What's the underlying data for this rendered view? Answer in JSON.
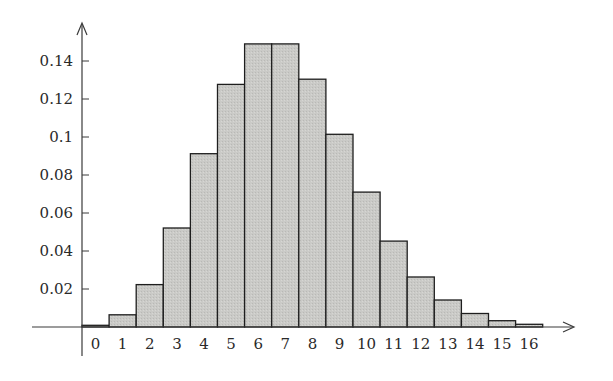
{
  "chart_data": {
    "type": "bar",
    "title": "",
    "xlabel": "",
    "ylabel": "",
    "categories": [
      "0",
      "1",
      "2",
      "3",
      "4",
      "5",
      "6",
      "7",
      "8",
      "9",
      "10",
      "11",
      "12",
      "13",
      "14",
      "15",
      "16"
    ],
    "values": [
      0.0009,
      0.0064,
      0.0223,
      0.0521,
      0.0912,
      0.1277,
      0.149,
      0.149,
      0.1304,
      0.1014,
      0.071,
      0.0452,
      0.0263,
      0.0142,
      0.0071,
      0.0033,
      0.0014
    ],
    "yticks": [
      "0.02",
      "0.04",
      "0.06",
      "0.08",
      "0.1",
      "0.12",
      "0.14"
    ],
    "ytick_values": [
      0.02,
      0.04,
      0.06,
      0.08,
      0.1,
      0.12,
      0.14
    ],
    "ylim": [
      0,
      0.16
    ],
    "grid": false,
    "legend": null,
    "bar_fill": "#c9c9c6",
    "bar_edge": "#1e1e1e",
    "axis_color": "#3a3a3a"
  }
}
